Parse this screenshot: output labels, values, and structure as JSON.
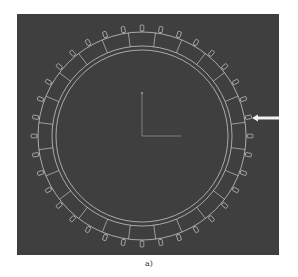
{
  "figure": {
    "caption": "a)",
    "background_color": "#3f3f3f",
    "line_color": "#d8d8d8",
    "arrow_color": "#f2f2f2",
    "ring": {
      "center": [
        142,
        136
      ],
      "outer_radius": 104,
      "middle_radius": 90,
      "inner_radius": 86,
      "tab_count": 36,
      "spoke_count": 24
    },
    "axes": {
      "origin": [
        142,
        136
      ],
      "y_end": [
        142,
        93
      ],
      "x_end": [
        181,
        136
      ]
    },
    "arrow": {
      "direction": "left",
      "tip": [
        252,
        118
      ],
      "tail": [
        279,
        118
      ]
    }
  }
}
